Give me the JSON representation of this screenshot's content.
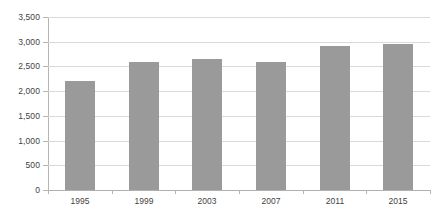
{
  "chart_data": {
    "type": "bar",
    "title": "",
    "subtitle": "",
    "xlabel": "",
    "ylabel": "",
    "categories": [
      "1995",
      "1999",
      "2003",
      "2007",
      "2011",
      "2015"
    ],
    "values": [
      2200,
      2580,
      2650,
      2580,
      2920,
      2950
    ],
    "series": [
      {
        "name": "",
        "values": [
          2200,
          2580,
          2650,
          2580,
          2920,
          2950
        ],
        "color": "#9a9a9a"
      }
    ],
    "ylim": [
      0,
      3500
    ],
    "ytick_values": [
      0,
      500,
      1000,
      1500,
      2000,
      2500,
      3000,
      3500
    ],
    "ytick_labels": [
      "0",
      "500",
      "1,000",
      "1,500",
      "2,000",
      "2,500",
      "3,000",
      "3,500"
    ],
    "grid": true,
    "grid_axis": "y",
    "legend": false,
    "legend_position": "none",
    "data_labels": false,
    "annotations": []
  },
  "style": {
    "background": "#ffffff",
    "bar_color": "#9a9a9a",
    "gridline_color": "#d9d9d9",
    "axis_color": "#b5b5b5",
    "baseline_color": "#b0b0b0",
    "text_color": "#3f3f3f"
  },
  "accessibility": {
    "chart_description": "Vertical bar chart with six gray bars for the years 1995, 1999, 2003, 2007, 2011 and 2015, with a vertical scale from 0 to 3,500."
  }
}
